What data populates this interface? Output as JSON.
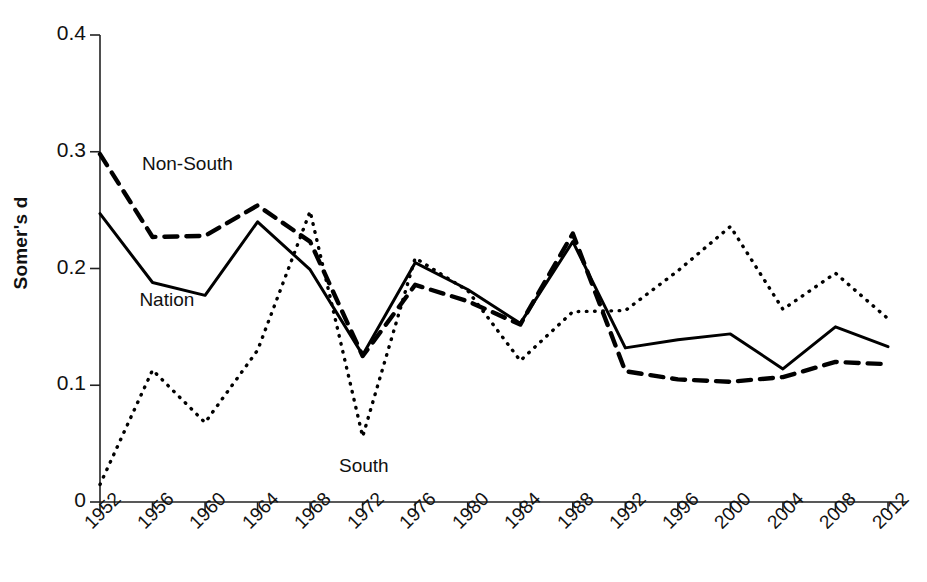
{
  "chart_data": {
    "type": "line",
    "title": "",
    "subtitle": "",
    "xlabel": "",
    "ylabel": "Somer's d",
    "xlim": [
      1952,
      2012
    ],
    "ylim": [
      0,
      0.4
    ],
    "grid": false,
    "legend_position": "inline-annotations",
    "x": [
      1952,
      1956,
      1960,
      1964,
      1968,
      1972,
      1976,
      1980,
      1984,
      1988,
      1992,
      1996,
      2000,
      2004,
      2008,
      2012
    ],
    "categories": [
      "1952",
      "1956",
      "1960",
      "1964",
      "1968",
      "1972",
      "1976",
      "1980",
      "1984",
      "1988",
      "1992",
      "1996",
      "2000",
      "2004",
      "2008",
      "2012"
    ],
    "ytick_labels": [
      "0",
      "0.1",
      "0.2",
      "0.3",
      "0.4"
    ],
    "ytick_values": [
      0,
      0.1,
      0.2,
      0.3,
      0.4
    ],
    "series": [
      {
        "name": "Non-South",
        "style": "dashed",
        "color": "#000000",
        "values": [
          0.298,
          0.227,
          0.228,
          0.254,
          0.223,
          0.125,
          0.186,
          0.172,
          0.152,
          0.23,
          0.112,
          0.105,
          0.103,
          0.107,
          0.12,
          0.118
        ]
      },
      {
        "name": "Nation",
        "style": "solid",
        "color": "#000000",
        "values": [
          0.247,
          0.188,
          0.177,
          0.24,
          0.199,
          0.126,
          0.205,
          0.182,
          0.153,
          0.223,
          0.132,
          0.139,
          0.144,
          0.114,
          0.15,
          0.133
        ]
      },
      {
        "name": "South",
        "style": "dotted",
        "color": "#000000",
        "values": [
          0.015,
          0.113,
          0.068,
          0.13,
          0.249,
          0.056,
          0.209,
          0.181,
          0.121,
          0.163,
          0.164,
          0.198,
          0.236,
          0.165,
          0.196,
          0.157
        ]
      }
    ],
    "annotations": [
      {
        "text": "Non-South",
        "x": 1955.2,
        "y": 0.289
      },
      {
        "text": "Nation",
        "x": 1955.0,
        "y": 0.172
      },
      {
        "text": "South",
        "x": 1970.2,
        "y": 0.03
      }
    ]
  }
}
